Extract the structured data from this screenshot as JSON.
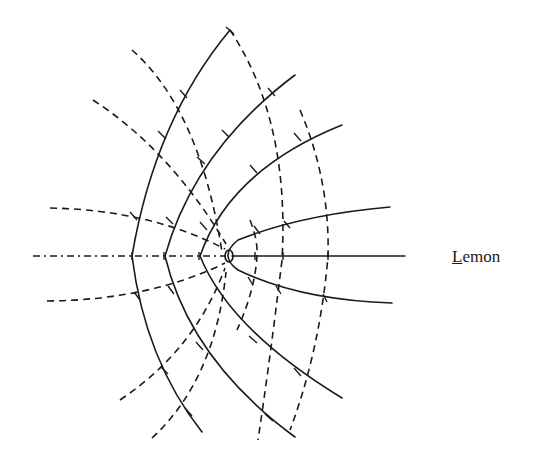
{
  "diagram": {
    "label": {
      "first_letter": "L",
      "rest": "emon"
    },
    "colors": {
      "stroke": "#1a1a1a",
      "background": "#ffffff"
    }
  }
}
